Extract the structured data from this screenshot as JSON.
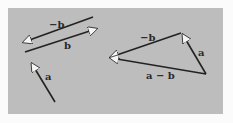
{
  "colors": {
    "background": "#fbfbfb",
    "panel": "#bdbdbd",
    "line": "#222222",
    "arrowhead": "#f4f4f4"
  },
  "left_figure": {
    "vectors": [
      {
        "id": "neg_b",
        "label": "−b",
        "from": [
          93,
          17
        ],
        "to": [
          22,
          43
        ]
      },
      {
        "id": "b",
        "label": "b",
        "from": [
          25,
          52
        ],
        "to": [
          98,
          28
        ]
      },
      {
        "id": "a",
        "label": "a",
        "from": [
          55,
          102
        ],
        "to": [
          31,
          62
        ]
      }
    ]
  },
  "right_figure": {
    "title": "Vector subtraction triangle",
    "vertices": {
      "left": [
        109,
        58
      ],
      "top": [
        181,
        33
      ],
      "bottom_right": [
        206,
        74
      ]
    },
    "vectors": [
      {
        "id": "neg_b",
        "label": "−b",
        "from": [
          181,
          33
        ],
        "to": [
          109,
          58
        ]
      },
      {
        "id": "a",
        "label": "a",
        "from": [
          206,
          74
        ],
        "to": [
          181,
          33
        ]
      },
      {
        "id": "a_minus_b",
        "label": "a − b",
        "from": [
          206,
          74
        ],
        "to": [
          109,
          58
        ]
      }
    ]
  },
  "labels": {
    "left_neg_b": "−b",
    "left_b": "b",
    "left_a": "a",
    "right_neg_b": "−b",
    "right_a": "a",
    "right_a_minus_b": "a − b"
  }
}
